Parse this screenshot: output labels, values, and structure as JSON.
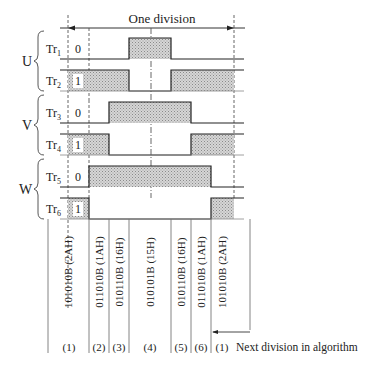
{
  "title": "One division",
  "footer_note": "Next division in algorithm",
  "groups": [
    {
      "label": "U",
      "rows": [
        0,
        1
      ]
    },
    {
      "label": "V",
      "rows": [
        2,
        3
      ]
    },
    {
      "label": "W",
      "rows": [
        4,
        5
      ]
    }
  ],
  "rows": [
    {
      "name": "Tr",
      "sub": "1",
      "initial": "0"
    },
    {
      "name": "Tr",
      "sub": "2",
      "initial": "1"
    },
    {
      "name": "Tr",
      "sub": "3",
      "initial": "0"
    },
    {
      "name": "Tr",
      "sub": "4",
      "initial": "1"
    },
    {
      "name": "Tr",
      "sub": "5",
      "initial": "0"
    },
    {
      "name": "Tr",
      "sub": "6",
      "initial": "1"
    }
  ],
  "states": [
    {
      "index": "(1)",
      "code": "101010B (2AH)"
    },
    {
      "index": "(2)",
      "code": "011010B (1AH)"
    },
    {
      "index": "(3)",
      "code": "010110B (16H)"
    },
    {
      "index": "(4)",
      "code": "010101B (15H)"
    },
    {
      "index": "(5)",
      "code": "010110B (16H)"
    },
    {
      "index": "(6)",
      "code": "011010B (1AH)"
    },
    {
      "index": "(1)",
      "code": "101010B (2AH)"
    }
  ],
  "colors": {
    "line": "#2a2a2a",
    "fill": "#c8c8c8",
    "dash": "#555555"
  }
}
